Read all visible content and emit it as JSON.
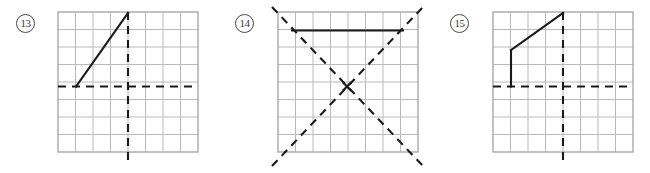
{
  "page": {
    "background_color": "#ffffff"
  },
  "style": {
    "grid_line_color": "#b9b9b9",
    "grid_border_color": "#a8a8a8",
    "dashed_line_color": "#1a1a1a",
    "solid_line_color": "#1a1a1a",
    "label_text_color": "#3a3a3a",
    "label_circle_color": "#4a4a4a"
  },
  "problems": [
    {
      "id": "problem-13",
      "number_label": "13",
      "label_x": 16,
      "label_y": 14,
      "grid": {
        "origin_x": 58,
        "origin_y": 12,
        "cell_size": 17.5,
        "columns": 8,
        "rows": 8
      },
      "axes": [
        {
          "name": "horizontal-axis-of-symmetry",
          "orientation": "horizontal",
          "x1": 58,
          "y1": 86.5,
          "x2": 198,
          "y2": 86.5,
          "style": "dashed"
        },
        {
          "name": "vertical-axis-of-symmetry",
          "orientation": "vertical",
          "x1": 128,
          "y1": 12,
          "x2": 128,
          "y2": 160,
          "style": "dashed"
        }
      ],
      "figure_segments": [
        {
          "name": "diagonal-segment",
          "x1": 76,
          "y1": 86.5,
          "x2": 128,
          "y2": 13,
          "style": "solid"
        }
      ]
    },
    {
      "id": "problem-14",
      "number_label": "14",
      "label_x": 235,
      "label_y": 14,
      "grid": {
        "origin_x": 278,
        "origin_y": 12,
        "cell_size": 17.5,
        "columns": 8,
        "rows": 8
      },
      "axes": [
        {
          "name": "diagonal-axis-of-symmetry-down-right",
          "orientation": "diagonal",
          "x1": 272,
          "y1": 7,
          "x2": 423,
          "y2": 166,
          "style": "dashed"
        },
        {
          "name": "diagonal-axis-of-symmetry-up-right",
          "orientation": "diagonal",
          "x1": 272,
          "y1": 166,
          "x2": 423,
          "y2": 7,
          "style": "dashed"
        }
      ],
      "figure_segments": [
        {
          "name": "horizontal-segment",
          "x1": 292,
          "y1": 30.5,
          "x2": 403,
          "y2": 30.5,
          "style": "solid"
        }
      ],
      "center_marker": {
        "name": "intersection-marker",
        "x": 347,
        "y": 86.5
      }
    },
    {
      "id": "problem-15",
      "number_label": "15",
      "label_x": 450,
      "label_y": 14,
      "grid": {
        "origin_x": 493,
        "origin_y": 12,
        "cell_size": 17.5,
        "columns": 8,
        "rows": 8
      },
      "axes": [
        {
          "name": "horizontal-axis-of-symmetry",
          "orientation": "horizontal",
          "x1": 493,
          "y1": 86.5,
          "x2": 633,
          "y2": 86.5,
          "style": "dashed"
        },
        {
          "name": "vertical-axis-of-symmetry",
          "orientation": "vertical",
          "x1": 563,
          "y1": 12,
          "x2": 563,
          "y2": 160,
          "style": "dashed"
        }
      ],
      "figure_segments": [
        {
          "name": "vertical-segment",
          "x1": 511,
          "y1": 86.5,
          "x2": 511,
          "y2": 50,
          "style": "solid"
        },
        {
          "name": "diagonal-segment",
          "x1": 511,
          "y1": 50,
          "x2": 563,
          "y2": 13,
          "style": "solid"
        }
      ]
    }
  ]
}
